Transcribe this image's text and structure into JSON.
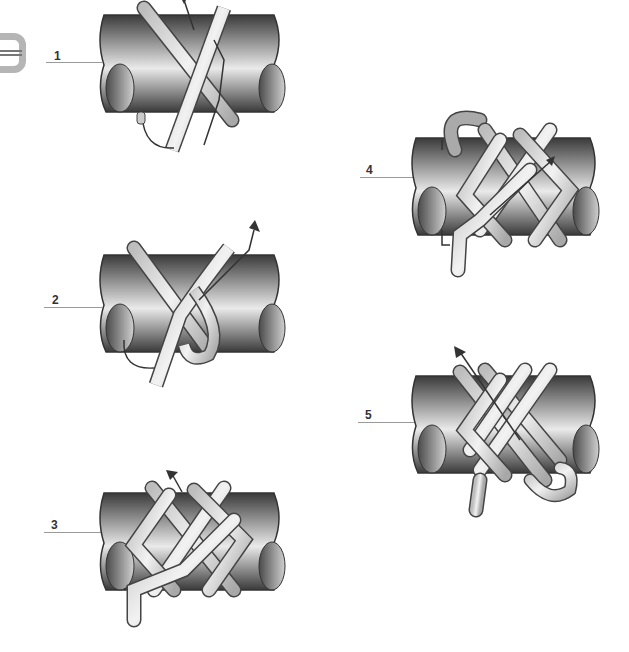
{
  "page": {
    "logo_icon": "knot-badge-icon",
    "steps": [
      {
        "number": "1",
        "label": "1"
      },
      {
        "number": "2",
        "label": "2"
      },
      {
        "number": "3",
        "label": "3"
      },
      {
        "number": "4",
        "label": "4"
      },
      {
        "number": "5",
        "label": "5"
      }
    ]
  },
  "colors": {
    "pipe_dark": "#3a3a3a",
    "pipe_light": "#e8e8e8",
    "rope_fill": "#d8d8d8",
    "rope_outline": "#444444",
    "leader_line": "#9a9a9a",
    "label_text": "#333333"
  }
}
